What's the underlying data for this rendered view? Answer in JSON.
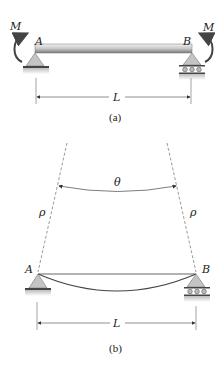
{
  "figure": {
    "panel_a": {
      "moment_left_label": "M",
      "moment_right_label": "M",
      "support_left_label": "A",
      "support_right_label": "B",
      "span_label": "L",
      "caption": "(a)"
    },
    "panel_b": {
      "angle_label": "θ",
      "radius_left_label": "ρ",
      "radius_right_label": "ρ",
      "support_left_label": "A",
      "support_right_label": "B",
      "span_label": "L",
      "caption": "(b)"
    },
    "colors": {
      "beam_light": "#e6e6e6",
      "beam_dark": "#8a8a8a",
      "support_fill": "#c4c4c4",
      "line": "#333333",
      "ground": "#d0d0d0"
    }
  }
}
